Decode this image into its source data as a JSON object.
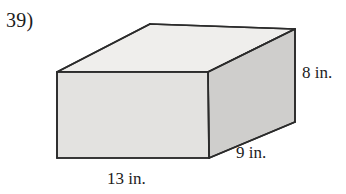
{
  "problem": {
    "number_label": "39)"
  },
  "figure": {
    "shape_name": "rectangular-prism",
    "labels": {
      "height": "8 in.",
      "depth": "9 in.",
      "length": "13 in."
    },
    "colors": {
      "outline": "#2b2b2b",
      "top_face": "#efeeec",
      "front_face": "#e3e2e0",
      "right_face": "#cfcecc",
      "background": "#ffffff"
    },
    "geometry": {
      "front_top_left": [
        57,
        72
      ],
      "front_top_right": [
        208,
        72
      ],
      "front_bottom_right": [
        209,
        158
      ],
      "front_bottom_left": [
        57,
        158
      ],
      "back_top_left": [
        150,
        24
      ],
      "back_top_right": [
        295,
        29
      ],
      "back_bottom_right": [
        295,
        122
      ]
    }
  }
}
